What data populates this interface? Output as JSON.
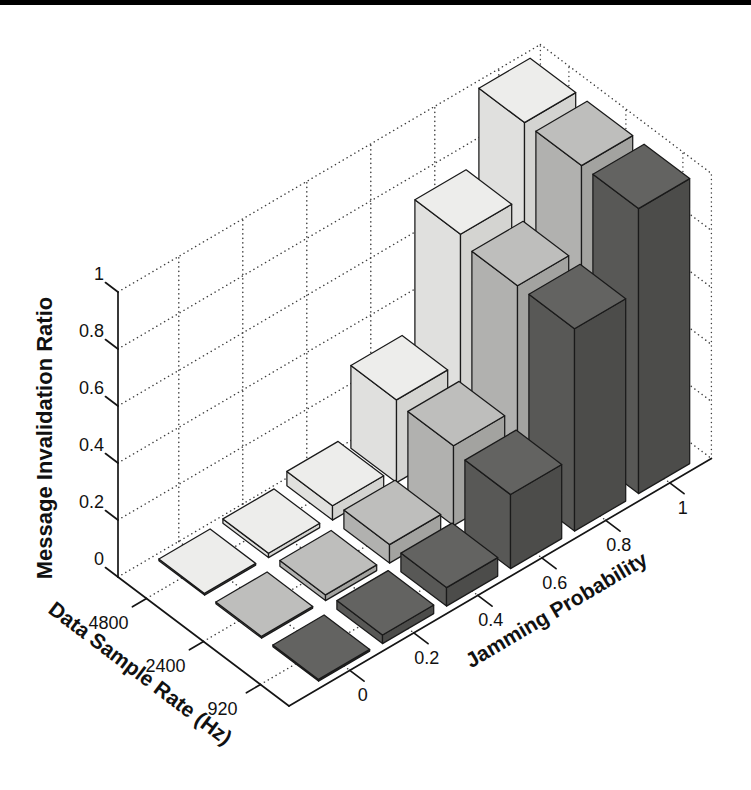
{
  "page": {
    "background": "#ffffff",
    "scan_edge": {
      "visible": true,
      "color": "#000000"
    }
  },
  "chart_data": {
    "type": "bar",
    "subtype": "bar3d",
    "title": "",
    "x_axis": {
      "label": "Jamming Probability",
      "tick_labels": [
        "0",
        "0.2",
        "0.4",
        "0.6",
        "0.8",
        "1"
      ],
      "values": [
        0,
        0.2,
        0.4,
        0.6,
        0.8,
        1
      ]
    },
    "row_axis": {
      "label": "Data Sample Rate (Hz)",
      "tick_labels": [
        "4800",
        "2400",
        "920"
      ],
      "values": [
        4800,
        2400,
        920
      ]
    },
    "z_axis": {
      "label": "Message Invalidation Ratio",
      "tick_labels": [
        "0",
        "0.2",
        "0.4",
        "0.6",
        "0.8",
        "1"
      ],
      "tick_values": [
        0,
        0.2,
        0.4,
        0.6,
        0.8,
        1
      ],
      "range": [
        0,
        1
      ],
      "grid": true
    },
    "series": [
      {
        "name": "4800",
        "values": [
          0.005,
          0.015,
          0.05,
          0.29,
          0.74,
          1.0
        ],
        "face_colors": {
          "top": "#ededeb",
          "left": "#e0e0de",
          "right": "#d4d4d1"
        }
      },
      {
        "name": "2400",
        "values": [
          0.005,
          0.02,
          0.065,
          0.28,
          0.71,
          1.0
        ],
        "face_colors": {
          "top": "#bebebc",
          "left": "#b1b1af",
          "right": "#a3a3a0"
        }
      },
      {
        "name": "920",
        "values": [
          0.005,
          0.03,
          0.065,
          0.26,
          0.71,
          1.0
        ],
        "face_colors": {
          "top": "#636361",
          "left": "#585856",
          "right": "#4c4c4a"
        }
      }
    ],
    "legend": "none",
    "grid_style": "dotted",
    "colors": {
      "bar_edge": "#1a1a1a",
      "grid_dots": "#3f3f3f",
      "axis_line": "#151515",
      "text": "#111111"
    }
  }
}
